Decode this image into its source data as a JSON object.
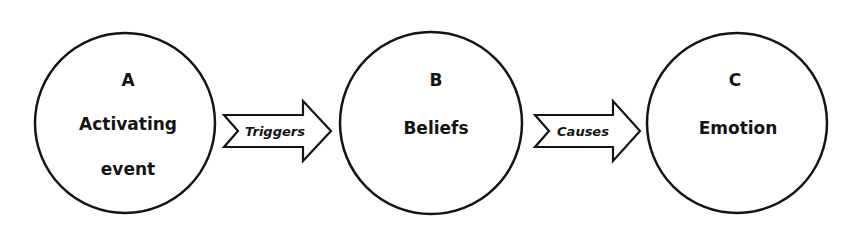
{
  "diagram": {
    "nodes": [
      {
        "letter": "A",
        "line1": "Activating",
        "line2": "event"
      },
      {
        "letter": "B",
        "line1": "Beliefs",
        "line2": ""
      },
      {
        "letter": "C",
        "line1": "Emotion",
        "line2": ""
      }
    ],
    "edges": [
      {
        "label": "Triggers",
        "from": "A",
        "to": "B"
      },
      {
        "label": "Causes",
        "from": "B",
        "to": "C"
      }
    ],
    "colors": {
      "stroke": "#141414",
      "fill": "#ffffff"
    }
  }
}
